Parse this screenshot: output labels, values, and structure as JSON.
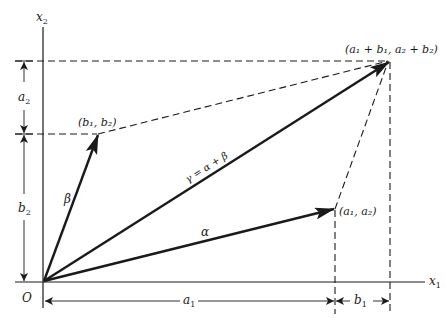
{
  "diagram": {
    "type": "vector-addition-parallelogram",
    "axes": {
      "x_label": "x",
      "x_sub": "1",
      "y_label": "x",
      "y_sub": "2",
      "origin_label": "O"
    },
    "vectors": [
      {
        "name": "alpha",
        "label": "α",
        "from": "O",
        "to": "(a1, a2)"
      },
      {
        "name": "beta",
        "label": "β",
        "from": "O",
        "to": "(b1, b2)"
      },
      {
        "name": "gamma",
        "label": "γ = α + β",
        "from": "O",
        "to": "(a1 + b1, a2 + b2)"
      }
    ],
    "points": {
      "sum": "(a₁ + b₁, a₂ + b₂)",
      "b": "(b₁, b₂)",
      "a": "(a₁, a₂)"
    },
    "labels": {
      "gamma": "γ = α + β",
      "alpha": "α",
      "beta": "β"
    },
    "dimensions": {
      "left_top": {
        "base": "a",
        "sub": "2"
      },
      "left_bottom": {
        "base": "b",
        "sub": "2"
      },
      "bottom_left": {
        "base": "a",
        "sub": "1"
      },
      "bottom_right": {
        "base": "b",
        "sub": "1"
      }
    },
    "colors": {
      "ink": "#1a1a1a",
      "background": "#ffffff"
    }
  }
}
